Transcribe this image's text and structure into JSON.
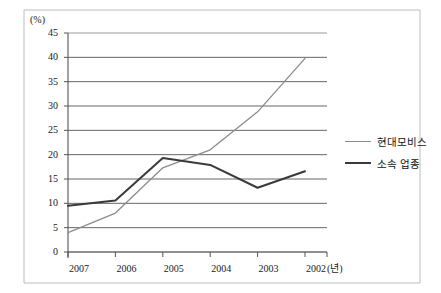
{
  "chart_data": {
    "type": "line",
    "title": "",
    "xlabel": "년",
    "ylabel": "(%)",
    "categories": [
      "2007",
      "2006",
      "2005",
      "2004",
      "2003",
      "2002"
    ],
    "ylim": [
      0,
      45
    ],
    "ytick_step": 5,
    "yticks": [
      "45",
      "40",
      "35",
      "30",
      "25",
      "20",
      "15",
      "10",
      "5",
      "0"
    ],
    "grid": true,
    "legend_position": "right",
    "series": [
      {
        "name": "현대모비스",
        "color": "#8c8c8c",
        "values": [
          4.0,
          8.0,
          17.3,
          21.0,
          28.8,
          39.8
        ]
      },
      {
        "name": "소속 업종",
        "color": "#3a3a3a",
        "values": [
          9.5,
          10.6,
          19.3,
          17.9,
          13.2,
          16.6
        ]
      }
    ]
  },
  "axis": {
    "unit_label": "(%)",
    "x_unit_label": "(년)"
  },
  "legend": {
    "items": [
      {
        "label": "현대모비스"
      },
      {
        "label": "소속 업종"
      }
    ]
  }
}
